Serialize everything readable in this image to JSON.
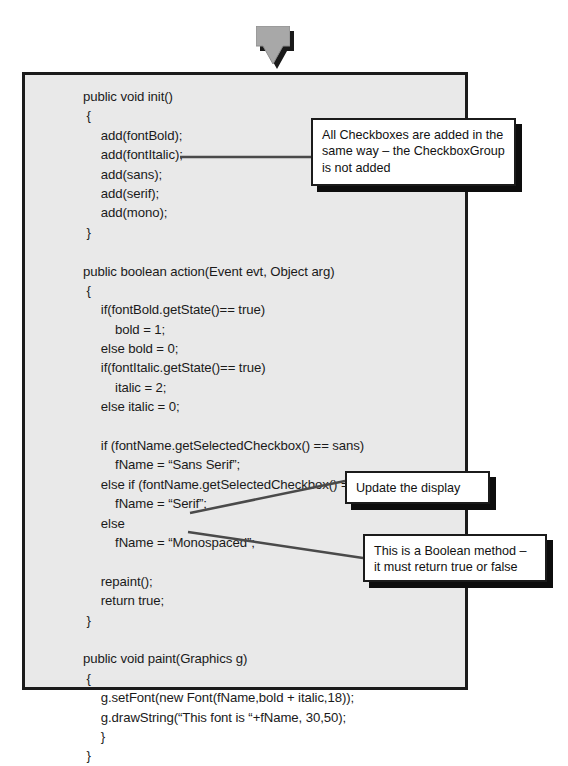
{
  "slide": {
    "title": "Java applet code listing with annotation callouts",
    "panel_background": "#e9e9e9",
    "panel_border_color": "#1b1b1b",
    "callout_background": "#ffffff",
    "shadow_color": "#0d0d0d",
    "arrow_color": "#a8a8a8"
  },
  "arrow": {
    "icon": "arrow-down-icon",
    "direction": "down"
  },
  "code": {
    "lines": [
      "public void init()",
      " {",
      "     add(fontBold);",
      "     add(fontItalic);",
      "     add(sans);",
      "     add(serif);",
      "     add(mono);",
      " }",
      "",
      "public boolean action(Event evt, Object arg)",
      " {",
      "     if(fontBold.getState()== true)",
      "         bold = 1;",
      "     else bold = 0;",
      "     if(fontItalic.getState()== true)",
      "         italic = 2;",
      "     else italic = 0;",
      "",
      "     if (fontName.getSelectedCheckbox() == sans)",
      "         fName = “Sans Serif”;",
      "     else if (fontName.getSelectedCheckbox() == serif)",
      "         fName = “Serif”;",
      "     else",
      "         fName = “Monospaced”;",
      "",
      "     repaint();",
      "     return true;",
      " }",
      "",
      "public void paint(Graphics g)",
      " {",
      "     g.setFont(new Font(fName,bold + italic,18));",
      "     g.drawString(“This font is “+fName, 30,50);",
      "     }",
      " }"
    ]
  },
  "callouts": [
    {
      "id": "callout-1",
      "text": "All Checkboxes are added in the same way – the CheckboxGroup is not added"
    },
    {
      "id": "callout-2",
      "text": "Update the display"
    },
    {
      "id": "callout-3",
      "text": "This is a Boolean method – it must return true or false"
    }
  ]
}
